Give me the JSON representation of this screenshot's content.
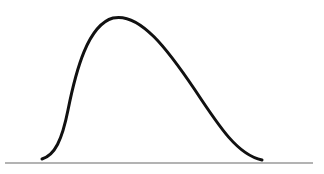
{
  "diagram": {
    "type": "skewed-distribution-curve",
    "skew": "right",
    "colors": {
      "background": "#ffffff",
      "curve": "#111111",
      "baseline": "#9a9a9a"
    },
    "baseline": {
      "x1": 5,
      "y1": 163,
      "x2": 313,
      "y2": 163
    },
    "curve_path": "M42,159 C55,155 62,140 68,110 C76,70 88,25 113,18 C140,12 168,50 195,90 C220,128 238,155 262,160"
  }
}
